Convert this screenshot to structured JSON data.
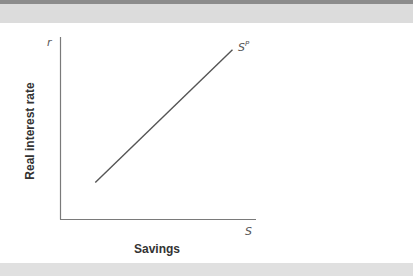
{
  "chart_data": {
    "type": "line",
    "title": "",
    "xlabel": "Savings",
    "ylabel": "Real interest rate",
    "x_axis_symbol": "S",
    "y_axis_symbol": "r",
    "grid": false,
    "legend": null,
    "series": [
      {
        "name": "S^P",
        "label_base": "S",
        "label_sup": "P",
        "color": "#555555",
        "points": [
          [
            0.18,
            0.2
          ],
          [
            0.88,
            0.93
          ]
        ]
      }
    ],
    "xlim": [
      0,
      1
    ],
    "ylim": [
      0,
      1
    ],
    "annotations": [
      "Upward-sloping private savings curve S^P: higher real interest rate increases savings"
    ]
  },
  "colors": {
    "axis": "#7a7a7a",
    "curve": "#555555",
    "band_top_dark": "#8c8c8c",
    "band_top_light": "#dcdcdc",
    "band_bottom": "#e0e0e0"
  }
}
